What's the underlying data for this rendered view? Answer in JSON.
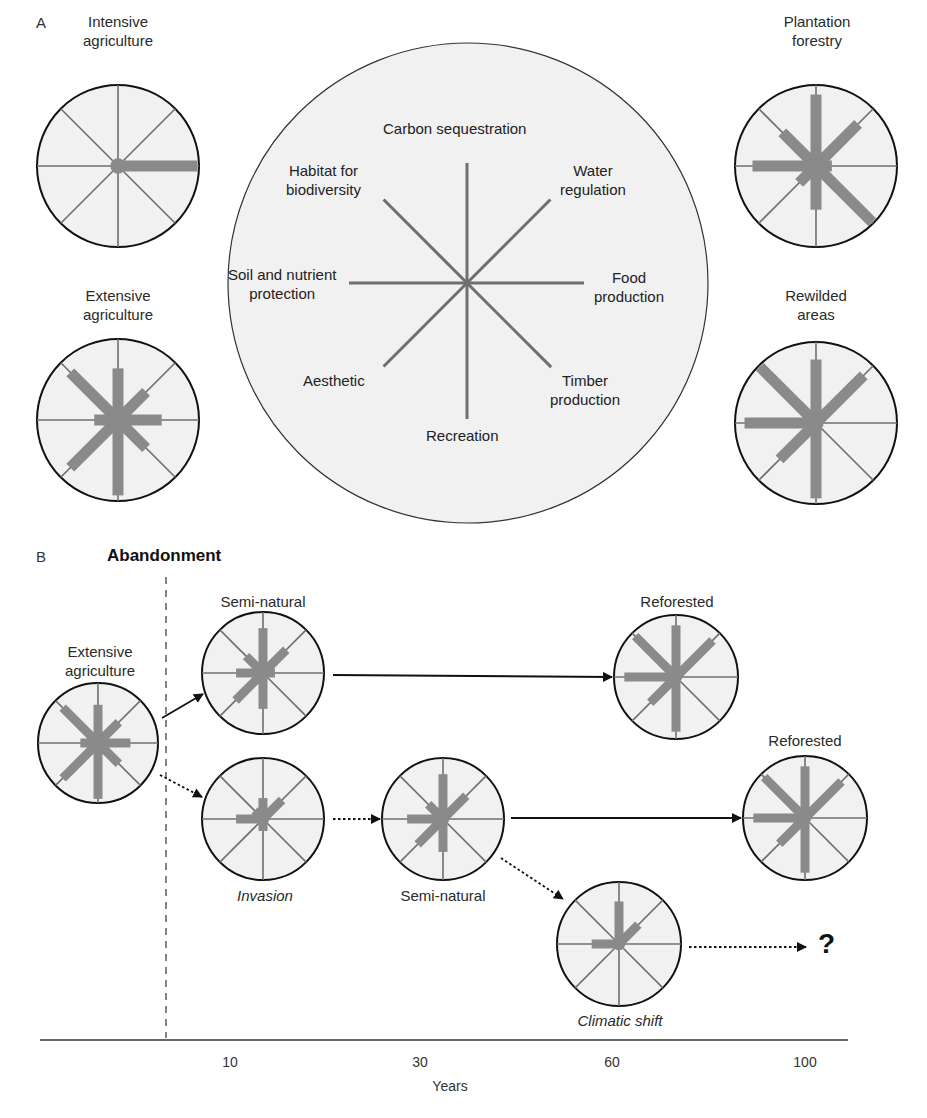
{
  "colors": {
    "circle_fill": "#f1f1f1",
    "circle_stroke": "#111111",
    "axis_line": "#6f6f6f",
    "bar": "#8a8a8a",
    "arrow": "#111111"
  },
  "axes_order": [
    "Carbon sequestration",
    "Water regulation",
    "Food production",
    "Timber production",
    "Recreation",
    "Aesthetic",
    "Soil and nutrient protection",
    "Habitat for biodiversity"
  ],
  "panel_a": {
    "letter": "A",
    "legend": {
      "labels": {
        "carbon": "Carbon sequestration",
        "habitat_1": "Habitat for",
        "habitat_2": "biodiversity",
        "water_1": "Water",
        "water_2": "regulation",
        "soil_1": "Soil and nutrient",
        "soil_2": "protection",
        "food_1": "Food",
        "food_2": "production",
        "aesthetic": "Aesthetic",
        "timber_1": "Timber",
        "timber_2": "production",
        "recreation": "Recreation"
      }
    },
    "systems": [
      {
        "id": "intensive",
        "label_1": "Intensive",
        "label_2": "agriculture",
        "values": [
          0,
          0,
          1.0,
          0,
          0,
          0,
          0,
          0
        ]
      },
      {
        "id": "extensive",
        "label_1": "Extensive",
        "label_2": "agriculture",
        "values": [
          0.65,
          0.5,
          0.55,
          0.5,
          0.95,
          0.85,
          0.3,
          0.85
        ]
      },
      {
        "id": "plantation",
        "label_1": "Plantation",
        "label_2": "forestry",
        "values": [
          0.9,
          0.75,
          0.2,
          1.0,
          0.55,
          0.3,
          0.8,
          0.6
        ]
      },
      {
        "id": "rewilded",
        "label_1": "Rewilded",
        "label_2": "areas",
        "values": [
          0.8,
          0.85,
          0,
          0,
          0.95,
          0.65,
          0.9,
          1.0
        ]
      }
    ]
  },
  "panel_b": {
    "letter": "B",
    "title": "Abandonment",
    "states": [
      {
        "id": "extensive",
        "label": "Extensive agriculture",
        "label_1": "Extensive",
        "label_2": "agriculture",
        "values": [
          0.65,
          0.5,
          0.55,
          0.5,
          0.95,
          0.85,
          0.3,
          0.85
        ]
      },
      {
        "id": "semi_top",
        "label": "Semi-natural",
        "values": [
          0.75,
          0.55,
          0.2,
          0,
          0.6,
          0.65,
          0.45,
          0.4
        ]
      },
      {
        "id": "invasion",
        "label": "Invasion",
        "values": [
          0.35,
          0.45,
          0,
          0,
          0.2,
          0,
          0.45,
          0.2
        ]
      },
      {
        "id": "semi_30",
        "label": "Semi-natural",
        "values": [
          0.75,
          0.55,
          0,
          0,
          0.55,
          0.6,
          0.6,
          0.35
        ]
      },
      {
        "id": "reforested_top",
        "label": "Reforested",
        "values": [
          0.85,
          0.85,
          0,
          0,
          0.9,
          0.6,
          0.85,
          0.95
        ]
      },
      {
        "id": "reforested_bottom",
        "label": "Reforested",
        "values": [
          0.85,
          0.85,
          0,
          0,
          0.9,
          0.6,
          0.85,
          0.95
        ]
      },
      {
        "id": "climatic",
        "label": "Climatic shift",
        "values": [
          0.7,
          0.45,
          0,
          0,
          0,
          0,
          0.45,
          0
        ]
      }
    ],
    "unknown_outcome": "?",
    "axis": {
      "label": "Years",
      "ticks": [
        "10",
        "30",
        "60",
        "100"
      ]
    }
  }
}
